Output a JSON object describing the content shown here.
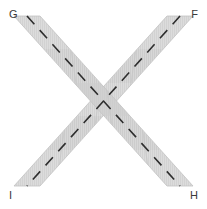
{
  "figure": {
    "type": "geometry-diagram",
    "width": 207,
    "height": 209,
    "background_color": "#ffffff"
  },
  "labels": {
    "top_left": "G",
    "top_right": "F",
    "bottom_left": "I",
    "bottom_right": "H"
  },
  "colors": {
    "background": "#ffffff",
    "band_fill": "#d9d9d9",
    "band_fill_alt": "#d0d0d0",
    "band_overlap": "#c9c9c9",
    "band_edge": "#bfbfbf",
    "hatch": "#cfcfcf",
    "dash": "#2e2e2e",
    "label_text": "#3a3a3a"
  },
  "bands": [
    {
      "name": "band-g-h",
      "from_label": "G",
      "to_label": "H",
      "direction": "top-left-to-bottom-right",
      "segments": 5,
      "dashed_center_line": true
    },
    {
      "name": "band-f-i",
      "from_label": "F",
      "to_label": "I",
      "direction": "top-right-to-bottom-left",
      "segments": 5,
      "dashed_center_line": true
    }
  ],
  "center": {
    "marker": "x-crossing",
    "x": 103,
    "y": 104
  }
}
